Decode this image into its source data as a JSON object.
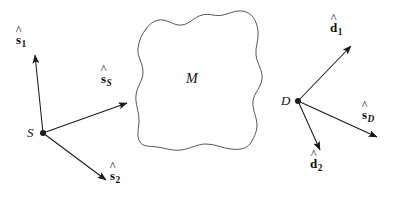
{
  "figure": {
    "background_color": "#ffffff",
    "stroke_color": "#1a1a1a",
    "region_stroke_color": "#555555",
    "width": 401,
    "height": 201
  },
  "chart_data": {
    "type": "diagram",
    "title": "",
    "points": [
      {
        "id": "S",
        "label": "S",
        "x": 43,
        "y": 133,
        "label_x": 27,
        "label_y": 126
      },
      {
        "id": "D",
        "label": "D",
        "x": 298,
        "y": 101,
        "label_x": 281,
        "label_y": 94
      }
    ],
    "regions": [
      {
        "id": "M",
        "label": "M",
        "label_x": 186,
        "label_y": 72
      }
    ],
    "vectors": [
      {
        "id": "s1",
        "base": "s",
        "subscript": "1",
        "subscript_italic": false,
        "hat": true,
        "from": "S",
        "x1": 43,
        "y1": 133,
        "x2": 35,
        "y2": 55,
        "label_x": 16,
        "label_y": 33
      },
      {
        "id": "sS",
        "base": "s",
        "subscript": "S",
        "subscript_italic": true,
        "hat": true,
        "from": "S",
        "x1": 43,
        "y1": 133,
        "x2": 127,
        "y2": 103,
        "label_x": 101,
        "label_y": 72
      },
      {
        "id": "s2",
        "base": "s",
        "subscript": "2",
        "subscript_italic": false,
        "hat": true,
        "from": "S",
        "x1": 43,
        "y1": 133,
        "x2": 106,
        "y2": 180,
        "label_x": 110,
        "label_y": 169
      },
      {
        "id": "d1",
        "base": "d",
        "subscript": "1",
        "subscript_italic": false,
        "hat": true,
        "from": "D",
        "x1": 298,
        "y1": 101,
        "x2": 351,
        "y2": 46,
        "label_x": 330,
        "label_y": 21
      },
      {
        "id": "sD",
        "base": "s",
        "subscript": "D",
        "subscript_italic": true,
        "hat": true,
        "from": "D",
        "x1": 298,
        "y1": 101,
        "x2": 377,
        "y2": 137,
        "label_x": 362,
        "label_y": 108
      },
      {
        "id": "d2",
        "base": "d",
        "subscript": "2",
        "subscript_italic": false,
        "hat": true,
        "from": "D",
        "x1": 298,
        "y1": 101,
        "x2": 320,
        "y2": 150,
        "label_x": 310,
        "label_y": 157
      }
    ],
    "region_outline_path": "M 146,29 C 150,23 156,19 163,20 C 170,21 175,26 182,25 C 190,24 194,17 202,15 C 210,13 216,17 223,15 C 231,13 238,9 246,12 C 254,15 257,23 258,31 C 259,40 255,47 256,55 C 257,64 263,70 262,79 C 261,88 254,93 253,101 C 252,110 257,117 257,125 C 257,133 253,139 250,144 C 246,149 239,150 231,149 C 222,148 215,144 206,144 C 197,144 190,149 181,150 C 172,151 165,148 157,147 C 150,146 143,147 140,142 C 136,136 139,128 139,120 C 139,111 135,104 136,95 C 137,86 143,81 143,72 C 143,63 137,57 138,48 C 139,40 142,34 146,29 Z",
    "hat_glyph": "^"
  }
}
